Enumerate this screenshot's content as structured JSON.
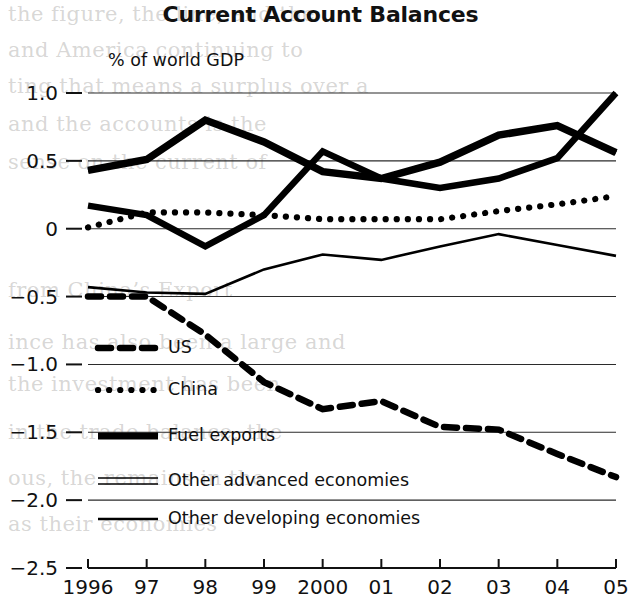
{
  "chart_data": {
    "type": "line",
    "title": "Current Account Balances",
    "subtitle": "% of world GDP",
    "ylabel": "",
    "xlabel": "",
    "grid": "horizontal",
    "legend_position": "inside-lower-left",
    "ylim": [
      -2.5,
      1.0
    ],
    "yticks": [
      "1.0",
      "0.5",
      "0",
      "−0.5",
      "−1.0",
      "−1.5",
      "−2.0",
      "−2.5"
    ],
    "ytick_values": [
      1.0,
      0.5,
      0,
      -0.5,
      -1.0,
      -1.5,
      -2.0,
      -2.5
    ],
    "categories": [
      "1996",
      "97",
      "98",
      "99",
      "2000",
      "01",
      "02",
      "03",
      "04",
      "05"
    ],
    "x": [
      1996,
      1997,
      1998,
      1999,
      2000,
      2001,
      2002,
      2003,
      2004,
      2005
    ],
    "series": [
      {
        "name": "US",
        "style": "thick-dashed",
        "values": [
          -0.5,
          -0.5,
          -0.78,
          -1.13,
          -1.33,
          -1.27,
          -1.46,
          -1.48,
          -1.66,
          -1.83
        ]
      },
      {
        "name": "China",
        "style": "dotted",
        "values": [
          0.01,
          0.12,
          0.12,
          0.1,
          0.07,
          0.07,
          0.07,
          0.13,
          0.18,
          0.24
        ]
      },
      {
        "name": "Fuel exports",
        "style": "thick-solid",
        "values": [
          0.17,
          0.1,
          -0.13,
          0.1,
          0.57,
          0.37,
          0.3,
          0.37,
          0.52,
          1.0
        ]
      },
      {
        "name": "Other advanced economies",
        "style": "double-line",
        "values": [
          0.43,
          0.51,
          0.8,
          0.64,
          0.42,
          0.37,
          0.49,
          0.69,
          0.76,
          0.56
        ]
      },
      {
        "name": "Other developing economies",
        "style": "solid",
        "values": [
          -0.43,
          -0.47,
          -0.48,
          -0.3,
          -0.19,
          -0.23,
          -0.13,
          -0.04,
          -0.12,
          -0.2
        ]
      }
    ]
  },
  "legend": {
    "items": [
      {
        "label": "US",
        "swatch": "thick-dashed"
      },
      {
        "label": "China",
        "swatch": "dotted"
      },
      {
        "label": "Fuel exports",
        "swatch": "thick-solid"
      },
      {
        "label": "Other advanced economies",
        "swatch": "double-line"
      },
      {
        "label": "Other developing economies",
        "swatch": "solid"
      }
    ]
  },
  "page_bleed": {
    "lines": [
      "the figure, the line, and the",
      "and America continuing to",
      "ting that means a surplus over a",
      "and the accounts is the",
      "sense on the current of",
      "from China’s Export",
      "ince has also been a large and",
      "the investment has been",
      "in the trade balance, the",
      "ous, the remains in the",
      "as their economies"
    ]
  }
}
